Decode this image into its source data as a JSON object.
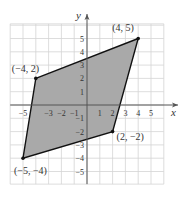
{
  "chart_data": {
    "type": "scatter",
    "title": "",
    "xlabel": "x",
    "ylabel": "y",
    "xlim": [
      -6,
      6
    ],
    "ylim": [
      -6,
      6
    ],
    "grid": true,
    "x_ticks": [
      -5,
      -3,
      -2,
      -1,
      1,
      2,
      3,
      4,
      5
    ],
    "x_tick_labels": [
      "−5",
      "−3",
      "−2",
      "−1",
      "1",
      "2",
      "3",
      "4",
      "5"
    ],
    "y_ticks": [
      5,
      4,
      3,
      2,
      1,
      -1,
      -2,
      -3,
      -4,
      -5
    ],
    "y_tick_labels": [
      "5",
      "4",
      "3",
      "2",
      "1",
      "−1",
      "−2",
      "−3",
      "−4",
      "−5"
    ],
    "shape": "parallelogram",
    "fill_color": "#a9a9a9",
    "vertices": [
      {
        "x": -4,
        "y": 2,
        "label": "(−4, 2)"
      },
      {
        "x": 4,
        "y": 5,
        "label": "(4, 5)"
      },
      {
        "x": 2,
        "y": -2,
        "label": "(2, −2)"
      },
      {
        "x": -5,
        "y": -4,
        "label": "(−5, −4)"
      }
    ]
  }
}
